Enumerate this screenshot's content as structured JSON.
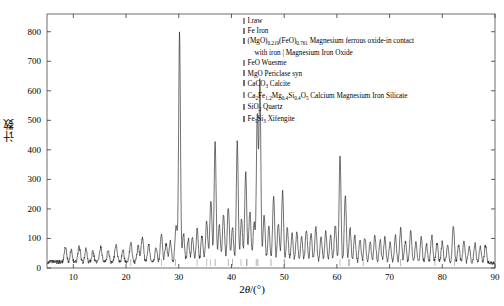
{
  "axes": {
    "ylabel": "计数",
    "xlabel_prefix": "2",
    "xlabel_theta": "θ",
    "xlabel_suffix": "/(°)",
    "x_ticks": [
      10,
      20,
      30,
      40,
      50,
      60,
      70,
      80,
      90
    ],
    "y_ticks": [
      0,
      100,
      200,
      300,
      400,
      500,
      600,
      700,
      800
    ],
    "xlim": [
      5,
      90
    ],
    "ylim": [
      0,
      860
    ]
  },
  "legend": {
    "items": [
      {
        "marker": "#8c8c8c",
        "label": "I.raw",
        "html": "I.raw"
      },
      {
        "marker": "#7a7a7a",
        "label": "Fe Iron",
        "html": "Fe Iron"
      },
      {
        "marker": "#6e6e6e",
        "label": "(MgO)0.219(FeO)0.761 Magnesium ferrous oxide-in contact with iron | Magnesium Iron Oxide",
        "html": "(MgO)<sub>0.219</sub>(FeO)<sub>0.761</sub> Magnesium ferrous oxide-in contact<br><span class=\"legend-cont\">with iron | Magnesium Iron Oxide</span>"
      },
      {
        "marker": "#8c8c8c",
        "label": "FeO Wuesme",
        "html": "FeO Wuesme"
      },
      {
        "marker": "#7a7a7a",
        "label": "MgO Periclase syn",
        "html": "MgO Periclase syn"
      },
      {
        "marker": "#6e6e6e",
        "label": "CaCO3 Calcite",
        "html": "CaCO<sub>3</sub> Calcite"
      },
      {
        "marker": "#8c8c8c",
        "label": "Ca2Fe1.2Mg0.4Si0.4O5 Calcium Magnesium Iron Silicate",
        "html": "Ca<sub>2</sub>Fe<sub>1.2</sub>Mg<sub>0.4</sub>Si<sub>0.4</sub>O<sub>5</sub> Calcium Magnesium Iron Silicate"
      },
      {
        "marker": "#7a7a7a",
        "label": "SiO2 Quartz",
        "html": "SiO<sub>2</sub> Quartz"
      },
      {
        "marker": "#6e6e6e",
        "label": "Fe5Si3 Xifengite",
        "html": "Fe<sub>5</sub>Si<sub>3</sub> Xifengite"
      }
    ]
  },
  "chart_data": {
    "type": "line",
    "title": "",
    "xlabel": "2θ/(°)",
    "ylabel": "计数",
    "xlim": [
      5,
      90
    ],
    "ylim": [
      0,
      860
    ],
    "grid": false,
    "legend_position": "top-right",
    "series": [
      {
        "name": "I.raw",
        "color": "#1a1a1a",
        "baseline": 18,
        "noise_amplitude": 14,
        "peaks": [
          {
            "x": 8.5,
            "y": 48,
            "w": 0.22
          },
          {
            "x": 9.6,
            "y": 40,
            "w": 0.2
          },
          {
            "x": 11.1,
            "y": 52,
            "w": 0.22
          },
          {
            "x": 12.4,
            "y": 45,
            "w": 0.2
          },
          {
            "x": 13.7,
            "y": 38,
            "w": 0.2
          },
          {
            "x": 15.2,
            "y": 50,
            "w": 0.22
          },
          {
            "x": 16.6,
            "y": 42,
            "w": 0.2
          },
          {
            "x": 18.1,
            "y": 58,
            "w": 0.24
          },
          {
            "x": 19.4,
            "y": 44,
            "w": 0.2
          },
          {
            "x": 20.9,
            "y": 62,
            "w": 0.24
          },
          {
            "x": 22.3,
            "y": 54,
            "w": 0.22
          },
          {
            "x": 23.1,
            "y": 86,
            "w": 0.22
          },
          {
            "x": 24.3,
            "y": 58,
            "w": 0.22
          },
          {
            "x": 25.7,
            "y": 50,
            "w": 0.2
          },
          {
            "x": 26.7,
            "y": 95,
            "w": 0.2
          },
          {
            "x": 27.6,
            "y": 60,
            "w": 0.22
          },
          {
            "x": 28.4,
            "y": 72,
            "w": 0.2
          },
          {
            "x": 29.5,
            "y": 120,
            "w": 0.22
          },
          {
            "x": 30.15,
            "y": 775,
            "w": 0.17
          },
          {
            "x": 30.9,
            "y": 95,
            "w": 0.2
          },
          {
            "x": 31.8,
            "y": 78,
            "w": 0.2
          },
          {
            "x": 32.6,
            "y": 86,
            "w": 0.2
          },
          {
            "x": 33.5,
            "y": 110,
            "w": 0.2
          },
          {
            "x": 34.4,
            "y": 92,
            "w": 0.2
          },
          {
            "x": 35.3,
            "y": 140,
            "w": 0.2
          },
          {
            "x": 36.1,
            "y": 215,
            "w": 0.2
          },
          {
            "x": 36.9,
            "y": 415,
            "w": 0.18
          },
          {
            "x": 37.7,
            "y": 130,
            "w": 0.2
          },
          {
            "x": 38.5,
            "y": 165,
            "w": 0.2
          },
          {
            "x": 39.4,
            "y": 190,
            "w": 0.2
          },
          {
            "x": 40.2,
            "y": 118,
            "w": 0.2
          },
          {
            "x": 41.1,
            "y": 410,
            "w": 0.18
          },
          {
            "x": 41.9,
            "y": 145,
            "w": 0.2
          },
          {
            "x": 42.7,
            "y": 305,
            "w": 0.19
          },
          {
            "x": 43.5,
            "y": 175,
            "w": 0.2
          },
          {
            "x": 44.3,
            "y": 135,
            "w": 0.2
          },
          {
            "x": 44.9,
            "y": 505,
            "w": 0.17
          },
          {
            "x": 45.4,
            "y": 620,
            "w": 0.17
          },
          {
            "x": 46.2,
            "y": 160,
            "w": 0.2
          },
          {
            "x": 47.1,
            "y": 120,
            "w": 0.2
          },
          {
            "x": 48.0,
            "y": 228,
            "w": 0.19
          },
          {
            "x": 48.9,
            "y": 135,
            "w": 0.2
          },
          {
            "x": 49.7,
            "y": 240,
            "w": 0.19
          },
          {
            "x": 50.6,
            "y": 118,
            "w": 0.2
          },
          {
            "x": 51.5,
            "y": 96,
            "w": 0.2
          },
          {
            "x": 52.4,
            "y": 104,
            "w": 0.2
          },
          {
            "x": 53.3,
            "y": 88,
            "w": 0.2
          },
          {
            "x": 54.2,
            "y": 112,
            "w": 0.2
          },
          {
            "x": 55.1,
            "y": 95,
            "w": 0.2
          },
          {
            "x": 56.0,
            "y": 120,
            "w": 0.2
          },
          {
            "x": 57.0,
            "y": 88,
            "w": 0.2
          },
          {
            "x": 57.9,
            "y": 105,
            "w": 0.2
          },
          {
            "x": 58.8,
            "y": 92,
            "w": 0.2
          },
          {
            "x": 59.7,
            "y": 130,
            "w": 0.2
          },
          {
            "x": 60.6,
            "y": 365,
            "w": 0.18
          },
          {
            "x": 61.6,
            "y": 228,
            "w": 0.19
          },
          {
            "x": 62.5,
            "y": 115,
            "w": 0.2
          },
          {
            "x": 63.4,
            "y": 92,
            "w": 0.2
          },
          {
            "x": 64.4,
            "y": 80,
            "w": 0.2
          },
          {
            "x": 65.3,
            "y": 88,
            "w": 0.2
          },
          {
            "x": 66.3,
            "y": 72,
            "w": 0.2
          },
          {
            "x": 67.2,
            "y": 96,
            "w": 0.2
          },
          {
            "x": 68.2,
            "y": 78,
            "w": 0.2
          },
          {
            "x": 69.1,
            "y": 85,
            "w": 0.2
          },
          {
            "x": 70.1,
            "y": 70,
            "w": 0.2
          },
          {
            "x": 71.1,
            "y": 92,
            "w": 0.2
          },
          {
            "x": 72.1,
            "y": 118,
            "w": 0.2
          },
          {
            "x": 73.0,
            "y": 75,
            "w": 0.2
          },
          {
            "x": 74.0,
            "y": 108,
            "w": 0.2
          },
          {
            "x": 75.0,
            "y": 70,
            "w": 0.2
          },
          {
            "x": 76.0,
            "y": 85,
            "w": 0.2
          },
          {
            "x": 77.0,
            "y": 65,
            "w": 0.2
          },
          {
            "x": 78.0,
            "y": 92,
            "w": 0.2
          },
          {
            "x": 79.0,
            "y": 68,
            "w": 0.2
          },
          {
            "x": 80.0,
            "y": 72,
            "w": 0.2
          },
          {
            "x": 81.0,
            "y": 60,
            "w": 0.2
          },
          {
            "x": 82.1,
            "y": 128,
            "w": 0.2
          },
          {
            "x": 83.1,
            "y": 62,
            "w": 0.2
          },
          {
            "x": 84.1,
            "y": 70,
            "w": 0.2
          },
          {
            "x": 85.1,
            "y": 58,
            "w": 0.2
          },
          {
            "x": 86.2,
            "y": 66,
            "w": 0.2
          },
          {
            "x": 87.2,
            "y": 55,
            "w": 0.2
          },
          {
            "x": 88.2,
            "y": 62,
            "w": 0.2
          }
        ]
      }
    ],
    "phase_markers": [
      {
        "name": "Fe Iron",
        "x": [
          44.7,
          65.0,
          82.3
        ],
        "color": "#7a7a7a"
      },
      {
        "name": "(MgO)0.219(FeO)0.761",
        "x": [
          36.9,
          42.9,
          62.3
        ],
        "color": "#6e6e6e"
      },
      {
        "name": "FeO Wuesme",
        "x": [
          36.0,
          41.8,
          60.6
        ],
        "color": "#8c8c8c"
      },
      {
        "name": "MgO Periclase syn",
        "x": [
          42.9,
          62.3,
          78.6
        ],
        "color": "#7a7a7a"
      },
      {
        "name": "CaCO3 Calcite",
        "x": [
          29.4,
          39.4,
          47.5
        ],
        "color": "#6e6e6e"
      },
      {
        "name": "Ca2Fe1.2Mg0.4Si0.4O5",
        "x": [
          33.5,
          35.3,
          50.0
        ],
        "color": "#8c8c8c"
      },
      {
        "name": "SiO2 Quartz",
        "x": [
          20.9,
          26.7,
          50.1
        ],
        "color": "#7a7a7a"
      },
      {
        "name": "Fe5Si3 Xifengite",
        "x": [
          40.2,
          45.0,
          72.1
        ],
        "color": "#6e6e6e"
      }
    ]
  }
}
